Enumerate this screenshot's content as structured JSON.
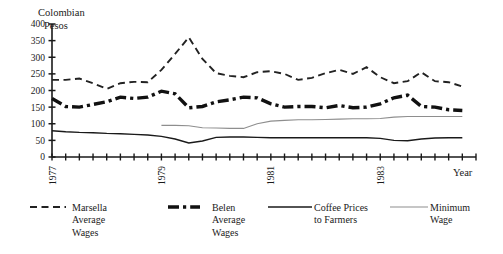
{
  "chart_data": {
    "type": "line",
    "title": "",
    "ylabel": "Colombian Pesos",
    "xlabel": "Year",
    "ylim": [
      0,
      400
    ],
    "yticks": [
      0,
      50,
      100,
      150,
      200,
      250,
      300,
      350,
      400
    ],
    "xlim": [
      1977.0,
      1984.75
    ],
    "xticks_labeled": [
      "1977",
      "1979",
      "1981",
      "1983"
    ],
    "xtick_interval": "quarterly",
    "grid": false,
    "legend_position": "bottom",
    "x": [
      1977.0,
      1977.25,
      1977.5,
      1977.75,
      1978.0,
      1978.25,
      1978.5,
      1978.75,
      1979.0,
      1979.25,
      1979.5,
      1979.75,
      1980.0,
      1980.25,
      1980.5,
      1980.75,
      1981.0,
      1981.25,
      1981.5,
      1981.75,
      1982.0,
      1982.25,
      1982.5,
      1982.75,
      1983.0,
      1983.25,
      1983.5,
      1983.75,
      1984.0,
      1984.25,
      1984.5
    ],
    "series": [
      {
        "name": "Marsella Average Wages",
        "style": "dashed",
        "color": "#222222",
        "width": 1.9,
        "values": [
          232,
          232,
          236,
          222,
          205,
          222,
          226,
          225,
          262,
          310,
          360,
          295,
          252,
          244,
          240,
          255,
          258,
          250,
          232,
          238,
          252,
          262,
          250,
          270,
          240,
          222,
          228,
          255,
          228,
          225,
          212
        ]
      },
      {
        "name": "Belen Average Wages",
        "style": "dash-dot-thick",
        "color": "#111111",
        "width": 3.4,
        "values": [
          176,
          152,
          150,
          158,
          166,
          180,
          176,
          180,
          198,
          190,
          148,
          152,
          166,
          172,
          180,
          178,
          160,
          150,
          152,
          152,
          148,
          155,
          148,
          150,
          160,
          178,
          186,
          152,
          150,
          142,
          140
        ]
      },
      {
        "name": "Coffee Prices to Farmers",
        "style": "solid",
        "color": "#1a1a1a",
        "width": 1.4,
        "values": [
          79,
          76,
          74,
          73,
          71,
          70,
          68,
          66,
          62,
          54,
          42,
          48,
          59,
          60,
          60,
          59,
          58,
          58,
          58,
          58,
          58,
          58,
          58,
          58,
          56,
          50,
          49,
          54,
          57,
          58,
          58
        ]
      },
      {
        "name": "Minimum Wage",
        "style": "solid-light",
        "color": "#8e8e8e",
        "width": 1.1,
        "start_index": 8,
        "values": [
          null,
          null,
          null,
          null,
          null,
          null,
          null,
          null,
          95,
          95,
          94,
          88,
          87,
          86,
          86,
          100,
          108,
          110,
          112,
          112,
          113,
          114,
          115,
          115,
          116,
          120,
          122,
          122,
          122,
          122,
          122
        ]
      }
    ]
  },
  "legend": {
    "items": [
      {
        "label_line1": "Marsella",
        "label_line2": "Average",
        "label_line3": "Wages",
        "swatch": "dashed"
      },
      {
        "label_line1": "Belen",
        "label_line2": "Average",
        "label_line3": "Wages",
        "swatch": "dash-dot-thick"
      },
      {
        "label_line1": "Coffee Prices",
        "label_line2": "to Farmers",
        "label_line3": "",
        "swatch": "solid"
      },
      {
        "label_line1": "Minimum",
        "label_line2": "Wage",
        "label_line3": "",
        "swatch": "solid-light"
      }
    ]
  },
  "axes": {
    "y_title_line1": "Colombian",
    "y_title_line2": "Pesos",
    "x_title": "Year"
  }
}
